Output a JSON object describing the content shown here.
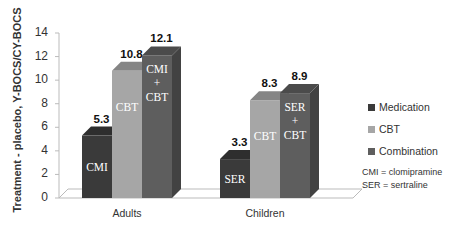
{
  "chart_data": {
    "type": "bar",
    "title": "",
    "xlabel": "",
    "ylabel": "Treatment - placebo, Y-BOCS/CY-BOCS",
    "ylim": [
      0,
      14
    ],
    "yticks": [
      0,
      2,
      4,
      6,
      8,
      10,
      12,
      14
    ],
    "categories": [
      "Adults",
      "Children"
    ],
    "series": [
      {
        "name": "Medication",
        "values": [
          5.3,
          3.3
        ],
        "color": "#3a3a3a",
        "bar_labels": [
          "CMI",
          "SER"
        ]
      },
      {
        "name": "CBT",
        "values": [
          10.8,
          8.3
        ],
        "color": "#a6a6a6",
        "bar_labels": [
          "CBT",
          "CBT"
        ]
      },
      {
        "name": "Combination",
        "values": [
          12.1,
          8.9
        ],
        "color": "#5e5e5e",
        "bar_labels": [
          "CMI\n+\nCBT",
          "SER\n+\nCBT"
        ]
      }
    ],
    "legend_position": "right",
    "grid": false,
    "style": "3d-column",
    "annotations": [
      "CMI = clomipramine",
      "SER = sertraline"
    ]
  },
  "axis": {
    "ylabel": "Treatment - placebo, Y-BOCS/CY-BOCS",
    "ticks": [
      "0",
      "2",
      "4",
      "6",
      "8",
      "10",
      "12",
      "14"
    ]
  },
  "categories": [
    "Adults",
    "Children"
  ],
  "legend": {
    "items": [
      {
        "label": "Medication",
        "color": "#3a3a3a"
      },
      {
        "label": "CBT",
        "color": "#a6a6a6"
      },
      {
        "label": "Combination",
        "color": "#5e5e5e"
      }
    ]
  },
  "abbreviations": {
    "cmi": "CMI = clomipramine",
    "ser": "SER = sertraline"
  }
}
